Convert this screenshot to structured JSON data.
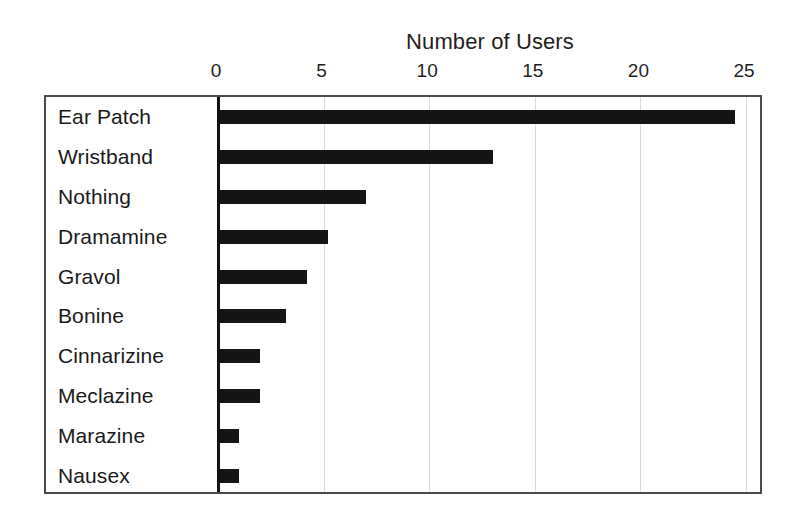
{
  "chart_data": {
    "type": "bar",
    "orientation": "horizontal",
    "title": "Number of Users",
    "xlabel": "",
    "ylabel": "",
    "xlim": [
      0,
      25
    ],
    "ylim": null,
    "grid": true,
    "legend": false,
    "legend_position": "none",
    "xticks": [
      0,
      5,
      10,
      15,
      20,
      25
    ],
    "xtick_labels": [
      "0",
      "5",
      "10",
      "15",
      "20",
      "25"
    ],
    "categories": [
      "Ear Patch",
      "Wristband",
      "Nothing",
      "Dramamine",
      "Gravol",
      "Bonine",
      "Cinnarizine",
      "Meclazine",
      "Marazine",
      "Nausex"
    ],
    "values": [
      24.5,
      13,
      7,
      5.2,
      4.2,
      3.2,
      2,
      2,
      1,
      1
    ],
    "bar_color": "#151515",
    "grid_color": "#d9d9d9",
    "axis_color": "#111111",
    "frame_color": "#4a4a4a",
    "background_color": "#ffffff"
  }
}
